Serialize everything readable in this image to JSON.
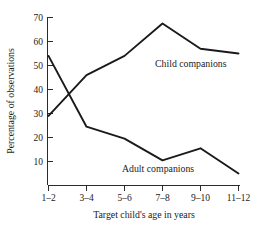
{
  "chart_data": {
    "type": "line",
    "title": "",
    "xlabel": "Target child's age in years",
    "ylabel": "Percentage of observations",
    "categories": [
      "1–2",
      "3–4",
      "5–6",
      "7–8",
      "9–10",
      "11–12"
    ],
    "ylim": [
      0,
      70
    ],
    "yticks": [
      10,
      20,
      30,
      40,
      50,
      60,
      70
    ],
    "ytick_labels": [
      "10",
      "20",
      "30",
      "40",
      "50",
      "60",
      "70"
    ],
    "grid": false,
    "legend_position": "inline-annotations",
    "series": [
      {
        "name": "Child companions",
        "label": "Child companions",
        "values": [
          29,
          46,
          54,
          67.5,
          57,
          55
        ],
        "color": "#1a1a1a"
      },
      {
        "name": "Adult companions",
        "label": "Adult companions",
        "values": [
          54,
          24.5,
          19.5,
          10.5,
          15.5,
          5
        ],
        "color": "#1a1a1a"
      }
    ],
    "annotations": [
      {
        "text": "Child companions",
        "series": "Child companions"
      },
      {
        "text": "Adult companions",
        "series": "Adult companions"
      }
    ]
  },
  "axis": {
    "y_title": "Percentage of observations",
    "x_title": "Target child's age in years",
    "y_tick_labels": [
      "70",
      "60",
      "50",
      "40",
      "30",
      "20",
      "10"
    ],
    "x_tick_labels": [
      "1–2",
      "3–4",
      "5–6",
      "7–8",
      "9–10",
      "11–12"
    ]
  },
  "labels": {
    "child": "Child companions",
    "adult": "Adult companions"
  }
}
